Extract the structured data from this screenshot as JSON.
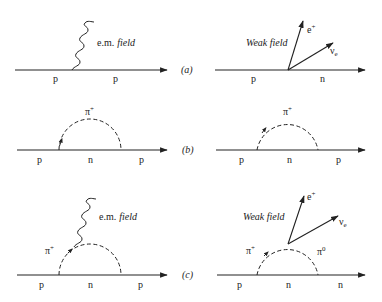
{
  "diagrams": {
    "a": {
      "label": "(a)",
      "left": {
        "particles": [
          "p",
          "p"
        ],
        "field_label_prefix": "e.m.",
        "field_label_suffix": "field"
      },
      "right": {
        "particles": [
          "p",
          "n"
        ],
        "field_label": "Weak field",
        "outgoing": [
          "e+",
          "νe"
        ],
        "positron_base": "e",
        "positron_sup": "+",
        "neutrino_base": "ν",
        "neutrino_sub": "e"
      }
    },
    "b": {
      "label": "(b)",
      "left": {
        "particles": [
          "p",
          "n",
          "p"
        ],
        "loop_label": "π+",
        "loop_base": "π",
        "loop_sup": "+"
      },
      "right": {
        "particles": [
          "p",
          "n",
          "p"
        ],
        "loop_label": "π+",
        "loop_base": "π",
        "loop_sup": "+"
      }
    },
    "c": {
      "label": "(c)",
      "left": {
        "particles": [
          "p",
          "n",
          "p"
        ],
        "loop_label": "π+",
        "loop_base": "π",
        "loop_sup": "+",
        "field_label_prefix": "e.m.",
        "field_label_suffix": "field"
      },
      "right": {
        "particles": [
          "p",
          "n",
          "n"
        ],
        "field_label": "Weak field",
        "pion_left_base": "π",
        "pion_left_sup": "+",
        "pion_right_base": "π",
        "pion_right_sup": "0",
        "positron_base": "e",
        "positron_sup": "+",
        "neutrino_base": "ν",
        "neutrino_sub": "e"
      }
    }
  },
  "colors": {
    "ink": "#222222",
    "background": "#ffffff"
  }
}
